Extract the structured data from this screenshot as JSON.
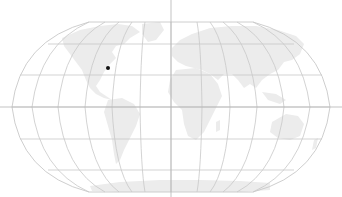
{
  "map": {
    "projection": "robinson-like",
    "graticule_step_deg": 30,
    "colors": {
      "background": "#ffffff",
      "land": "#ececec",
      "graticule": "#c8c8c8",
      "crosshair": "#b4b4b4",
      "marker": "#111111"
    },
    "crosshair": {
      "x": 171,
      "y": 107
    },
    "markers": [
      {
        "name": "location-marker",
        "region": "eastern North America",
        "x": 108,
        "y": 68
      }
    ]
  }
}
